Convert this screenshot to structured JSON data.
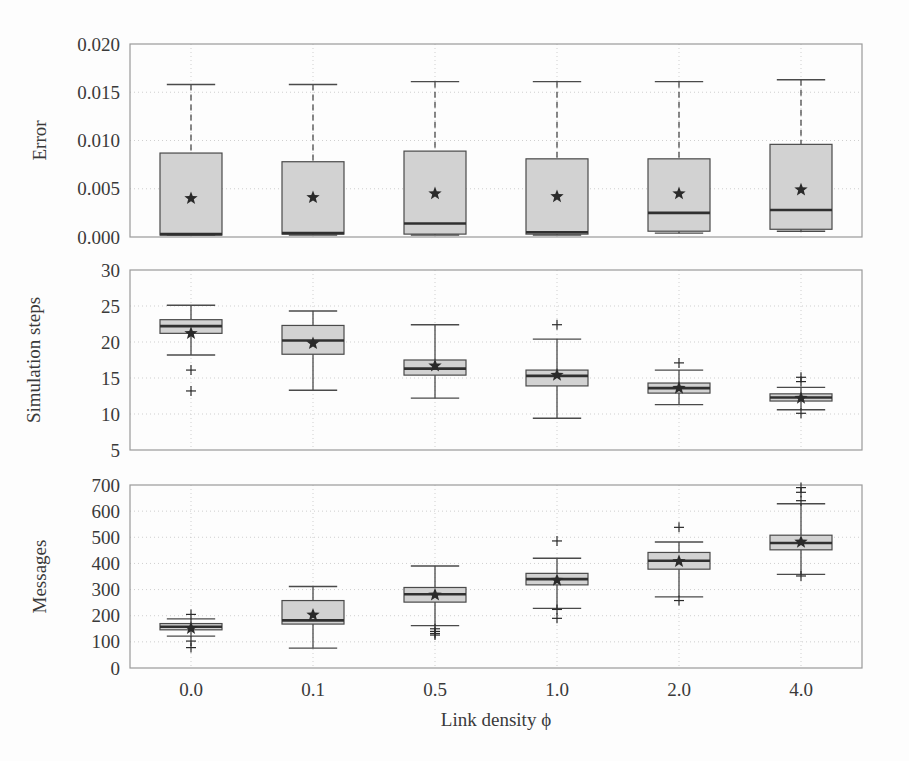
{
  "figure": {
    "background": "#fdfdfd",
    "xlabel": "Link density ϕ",
    "categories": [
      "0.0",
      "0.1",
      "0.5",
      "1.0",
      "2.0",
      "4.0"
    ],
    "box_fill": "#d2d2d2",
    "box_edge": "#4a4a4a",
    "median_color": "#303030",
    "whisker_color": "#4a4a4a",
    "mean_marker": "star",
    "mean_color": "#2a2a2a",
    "outlier_marker": "plus",
    "grid": true,
    "grid_color": "#c9c9c9",
    "frame_color": "#9a9a9a"
  },
  "chart_data": [
    {
      "type": "box",
      "panel": 1,
      "title": "",
      "ylabel": "Error",
      "xlabel": "",
      "categories": [
        "0.0",
        "0.1",
        "0.5",
        "1.0",
        "2.0",
        "4.0"
      ],
      "ylim": [
        0.0,
        0.02
      ],
      "yticks": [
        0.0,
        0.005,
        0.01,
        0.015,
        0.02
      ],
      "ytick_labels": [
        "0.000",
        "0.005",
        "0.010",
        "0.015",
        "0.020"
      ],
      "grid": true,
      "boxes": [
        {
          "category": "0.0",
          "whisker_low": 0.0002,
          "q1": 0.0002,
          "median": 0.0003,
          "q3": 0.0087,
          "whisker_high": 0.0158,
          "mean": 0.004,
          "outliers": []
        },
        {
          "category": "0.1",
          "whisker_low": 0.0002,
          "q1": 0.0003,
          "median": 0.0004,
          "q3": 0.0078,
          "whisker_high": 0.0158,
          "mean": 0.0041,
          "outliers": []
        },
        {
          "category": "0.5",
          "whisker_low": 0.0002,
          "q1": 0.0003,
          "median": 0.0014,
          "q3": 0.0089,
          "whisker_high": 0.0161,
          "mean": 0.0045,
          "outliers": []
        },
        {
          "category": "1.0",
          "whisker_low": 0.0002,
          "q1": 0.0003,
          "median": 0.0005,
          "q3": 0.0081,
          "whisker_high": 0.0161,
          "mean": 0.0042,
          "outliers": []
        },
        {
          "category": "2.0",
          "whisker_low": 0.0004,
          "q1": 0.0006,
          "median": 0.0025,
          "q3": 0.0081,
          "whisker_high": 0.0161,
          "mean": 0.0045,
          "outliers": []
        },
        {
          "category": "4.0",
          "whisker_low": 0.0006,
          "q1": 0.0008,
          "median": 0.0028,
          "q3": 0.0096,
          "whisker_high": 0.0163,
          "mean": 0.0049,
          "outliers": []
        }
      ]
    },
    {
      "type": "box",
      "panel": 2,
      "title": "",
      "ylabel": "Simulation steps",
      "xlabel": "",
      "categories": [
        "0.0",
        "0.1",
        "0.5",
        "1.0",
        "2.0",
        "4.0"
      ],
      "ylim": [
        5,
        30
      ],
      "yticks": [
        5,
        10,
        15,
        20,
        25,
        30
      ],
      "ytick_labels": [
        "5",
        "10",
        "15",
        "20",
        "25",
        "30"
      ],
      "grid": true,
      "boxes": [
        {
          "category": "0.0",
          "whisker_low": 18.2,
          "q1": 21.2,
          "median": 22.2,
          "q3": 23.1,
          "whisker_high": 25.1,
          "mean": 21.2,
          "outliers": [
            16.1,
            13.2
          ]
        },
        {
          "category": "0.1",
          "whisker_low": 13.3,
          "q1": 18.3,
          "median": 20.2,
          "q3": 22.3,
          "whisker_high": 24.3,
          "mean": 19.8,
          "outliers": []
        },
        {
          "category": "0.5",
          "whisker_low": 12.2,
          "q1": 15.4,
          "median": 16.3,
          "q3": 17.5,
          "whisker_high": 22.4,
          "mean": 16.7,
          "outliers": []
        },
        {
          "category": "1.0",
          "whisker_low": 9.4,
          "q1": 13.9,
          "median": 15.3,
          "q3": 16.1,
          "whisker_high": 20.4,
          "mean": 15.4,
          "outliers": [
            22.4
          ]
        },
        {
          "category": "2.0",
          "whisker_low": 11.3,
          "q1": 12.9,
          "median": 13.6,
          "q3": 14.3,
          "whisker_high": 16.1,
          "mean": 13.6,
          "outliers": [
            17.1
          ]
        },
        {
          "category": "4.0",
          "whisker_low": 10.6,
          "q1": 11.8,
          "median": 12.3,
          "q3": 12.8,
          "whisker_high": 13.7,
          "mean": 12.2,
          "outliers": [
            15.1,
            14.5,
            10.1
          ]
        }
      ]
    },
    {
      "type": "box",
      "panel": 3,
      "title": "",
      "ylabel": "Messages",
      "xlabel": "Link density ϕ",
      "categories": [
        "0.0",
        "0.1",
        "0.5",
        "1.0",
        "2.0",
        "4.0"
      ],
      "ylim": [
        0,
        700
      ],
      "yticks": [
        0,
        100,
        200,
        300,
        400,
        500,
        600,
        700
      ],
      "ytick_labels": [
        "0",
        "100",
        "200",
        "300",
        "400",
        "500",
        "600",
        "700"
      ],
      "grid": true,
      "boxes": [
        {
          "category": "0.0",
          "whisker_low": 122,
          "q1": 146,
          "median": 158,
          "q3": 170,
          "whisker_high": 188,
          "mean": 152,
          "outliers": [
            205,
            103,
            78
          ]
        },
        {
          "category": "0.1",
          "whisker_low": 76,
          "q1": 168,
          "median": 182,
          "q3": 258,
          "whisker_high": 312,
          "mean": 203,
          "outliers": []
        },
        {
          "category": "0.5",
          "whisker_low": 162,
          "q1": 252,
          "median": 282,
          "q3": 308,
          "whisker_high": 390,
          "mean": 280,
          "outliers": [
            150,
            140,
            132,
            126
          ]
        },
        {
          "category": "1.0",
          "whisker_low": 228,
          "q1": 318,
          "median": 340,
          "q3": 362,
          "whisker_high": 420,
          "mean": 336,
          "outliers": [
            486,
            224,
            190
          ]
        },
        {
          "category": "2.0",
          "whisker_low": 272,
          "q1": 378,
          "median": 410,
          "q3": 442,
          "whisker_high": 482,
          "mean": 408,
          "outliers": [
            538,
            258
          ]
        },
        {
          "category": "4.0",
          "whisker_low": 358,
          "q1": 452,
          "median": 478,
          "q3": 508,
          "whisker_high": 628,
          "mean": 482,
          "outliers": [
            690,
            672,
            640,
            352
          ]
        }
      ]
    }
  ]
}
